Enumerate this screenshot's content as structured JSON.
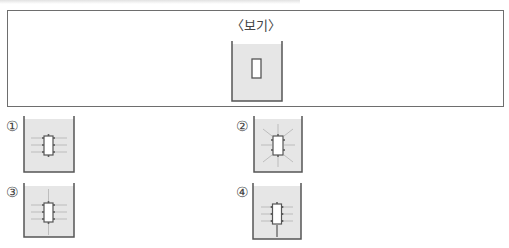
{
  "bogi": {
    "label": "〈보기〉",
    "figure": "beaker-with-rectangular-object"
  },
  "options": [
    {
      "number": "①",
      "figure": "beaker-horizontal-field-lines"
    },
    {
      "number": "②",
      "figure": "beaker-radial-field-lines"
    },
    {
      "number": "③",
      "figure": "beaker-horizontal-and-vertical-lines"
    },
    {
      "number": "④",
      "figure": "beaker-horizontal-and-bottom-vertical-line"
    }
  ],
  "colors": {
    "liquid": "#e6e6e6",
    "beaker_wall": "#555555",
    "object_border": "#555555",
    "field_line": "#aaaaaa"
  }
}
